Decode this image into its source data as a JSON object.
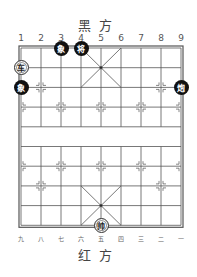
{
  "labels": {
    "top_side": "黑方",
    "bottom_side": "红方"
  },
  "top_numbers": [
    "1",
    "2",
    "3",
    "4",
    "5",
    "6",
    "7",
    "8",
    "9"
  ],
  "bottom_numbers": [
    "九",
    "八",
    "七",
    "六",
    "五",
    "四",
    "三",
    "二",
    "一"
  ],
  "board": {
    "columns": 9,
    "rows": 10,
    "line_color": "#555555",
    "border_color": "#555555"
  },
  "pieces": [
    {
      "name": "black-elephant-1",
      "label": "象",
      "side": "black",
      "col": 3,
      "row": 0
    },
    {
      "name": "black-general",
      "label": "将",
      "side": "black",
      "col": 4,
      "row": 0
    },
    {
      "name": "red-chariot",
      "label": "车",
      "side": "red",
      "col": 1,
      "row": 1
    },
    {
      "name": "black-elephant-2",
      "label": "象",
      "side": "black",
      "col": 1,
      "row": 2
    },
    {
      "name": "black-cannon",
      "label": "炮",
      "side": "black",
      "col": 9,
      "row": 2
    },
    {
      "name": "red-marshal",
      "label": "帅",
      "side": "red",
      "col": 5,
      "row": 9
    }
  ]
}
